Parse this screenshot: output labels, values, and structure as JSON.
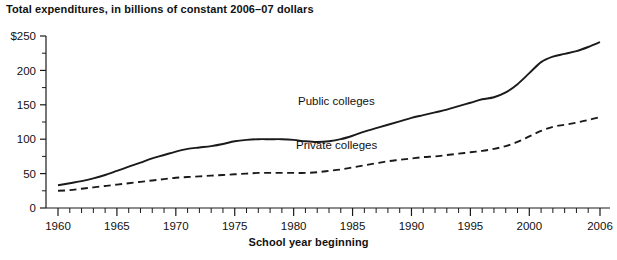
{
  "chart_data": {
    "type": "line",
    "title": "Total expenditures, in billions of constant 2006–07 dollars",
    "xlabel": "School year beginning",
    "ylabel": "",
    "xlim": [
      1960,
      2006
    ],
    "ylim": [
      0,
      250
    ],
    "grid": false,
    "legend_position": "inline-annotations",
    "y_ticks": [
      "$250",
      "200",
      "150",
      "100",
      "50",
      "0"
    ],
    "y_tick_values": [
      250,
      200,
      150,
      100,
      50,
      0
    ],
    "y_minor_tick_step": 25,
    "x_ticks": [
      "1960",
      "1965",
      "1970",
      "1975",
      "1980",
      "1985",
      "1990",
      "1995",
      "2000",
      "2006"
    ],
    "x_tick_values": [
      1960,
      1965,
      1970,
      1975,
      1980,
      1985,
      1990,
      1995,
      2000,
      2006
    ],
    "x_minor_tick_step": 1,
    "x": [
      1960,
      1961,
      1962,
      1963,
      1964,
      1965,
      1966,
      1967,
      1968,
      1969,
      1970,
      1971,
      1972,
      1973,
      1974,
      1975,
      1976,
      1977,
      1978,
      1979,
      1980,
      1981,
      1982,
      1983,
      1984,
      1985,
      1986,
      1987,
      1988,
      1989,
      1990,
      1991,
      1992,
      1993,
      1994,
      1995,
      1996,
      1997,
      1998,
      1999,
      2000,
      2001,
      2002,
      2003,
      2004,
      2005,
      2006
    ],
    "series": [
      {
        "name": "Public colleges",
        "style": "solid",
        "color": "#1a1a1a",
        "values": [
          33,
          36,
          39,
          43,
          48,
          54,
          60,
          66,
          72,
          77,
          82,
          86,
          88,
          90,
          93,
          97,
          99,
          100,
          100,
          100,
          99,
          97,
          96,
          97,
          100,
          105,
          111,
          116,
          121,
          126,
          131,
          135,
          139,
          143,
          148,
          153,
          158,
          161,
          168,
          180,
          196,
          212,
          220,
          224,
          228,
          234,
          241
        ]
      },
      {
        "name": "Private colleges",
        "style": "dashed",
        "color": "#1a1a1a",
        "values": [
          25,
          26,
          28,
          30,
          32,
          34,
          36,
          38,
          40,
          42,
          44,
          45,
          46,
          47,
          48,
          49,
          50,
          51,
          51,
          51,
          51,
          51,
          52,
          54,
          56,
          59,
          62,
          65,
          68,
          70,
          72,
          74,
          75,
          77,
          79,
          81,
          83,
          86,
          90,
          96,
          104,
          112,
          118,
          121,
          124,
          128,
          132
        ]
      }
    ],
    "annotations": [
      {
        "text": "Public colleges",
        "x_px": 298,
        "y_px": 95
      },
      {
        "text": "Private colleges",
        "x_px": 296,
        "y_px": 139
      }
    ]
  }
}
